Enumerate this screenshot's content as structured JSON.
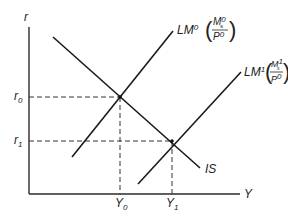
{
  "diagram": {
    "axes": {
      "y_label": "r",
      "x_label": "Y"
    },
    "levels": {
      "r0_base": "r",
      "r0_sub": "0",
      "r1_base": "r",
      "r1_sub": "1",
      "y0_base": "Y",
      "y0_sub": "0",
      "y1_base": "Y",
      "y1_sub": "1"
    },
    "curves": {
      "is": {
        "label": "IS"
      },
      "lm0": {
        "name": "LM",
        "sup": "0",
        "num_base": "M",
        "num_sup": "0",
        "num_sub": "s",
        "den_base": "P",
        "den_sup": "0"
      },
      "lm1": {
        "name": "LM",
        "sup": "1",
        "num_base": "M",
        "num_sup": "1",
        "num_sub": "s",
        "den_base": "P",
        "den_sup": "0"
      }
    },
    "colors": {
      "line": "#1a1a1a",
      "background": "#ffffff"
    }
  }
}
